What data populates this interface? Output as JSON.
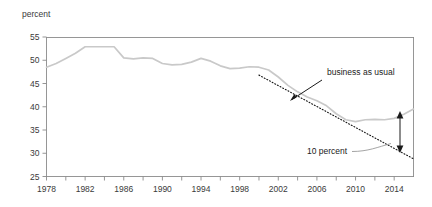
{
  "chart_data": {
    "type": "line",
    "title": "",
    "subtitle": "",
    "xlabel": "",
    "ylabel": "percent",
    "ylim": [
      25,
      55
    ],
    "xlim": [
      1978,
      2016
    ],
    "grid": false,
    "legend_position": "none",
    "yticks": [
      "55",
      "50",
      "45",
      "40",
      "35",
      "30",
      "25"
    ],
    "ytick_values": [
      55,
      50,
      45,
      40,
      35,
      30,
      25
    ],
    "xticks": [
      "1978",
      "1982",
      "1986",
      "1990",
      "1994",
      "1998",
      "2002",
      "2006",
      "2010",
      "2014"
    ],
    "xtick_values": [
      1978,
      1982,
      1986,
      1990,
      1994,
      1998,
      2002,
      2006,
      2010,
      2014
    ],
    "xtick_minor_values": [
      1980,
      1984,
      1988,
      1992,
      1996,
      2000,
      2004,
      2008,
      2012,
      2016
    ],
    "series": [
      {
        "name": "actual",
        "style": "solid",
        "color": "#c9c9c9",
        "x": [
          1978,
          1979,
          1980,
          1981,
          1982,
          1983,
          1984,
          1985,
          1986,
          1987,
          1988,
          1989,
          1990,
          1991,
          1992,
          1993,
          1994,
          1995,
          1996,
          1997,
          1998,
          1999,
          2000,
          2001,
          2002,
          2003,
          2004,
          2005,
          2006,
          2007,
          2008,
          2009,
          2010,
          2011,
          2012,
          2013,
          2014,
          2015,
          2016
        ],
        "values": [
          48.5,
          49.3,
          50.4,
          51.5,
          52.9,
          52.9,
          52.9,
          52.9,
          50.5,
          50.3,
          50.5,
          50.4,
          49.3,
          49.0,
          49.1,
          49.6,
          50.4,
          49.8,
          48.8,
          48.2,
          48.3,
          48.6,
          48.5,
          47.9,
          46.4,
          44.6,
          43.2,
          42.1,
          41.3,
          40.2,
          38.5,
          37.2,
          36.8,
          37.2,
          37.3,
          37.2,
          37.5,
          38.4,
          39.5
        ]
      },
      {
        "name": "business as usual",
        "style": "dotted",
        "color": "#1a1a1a",
        "x": [
          2000,
          2016
        ],
        "values": [
          46.8,
          28.8
        ]
      }
    ],
    "annotations": [
      {
        "name": "business-as-usual",
        "text": "business as usual",
        "text_x": 327,
        "text_y": 75,
        "arrow_from_x": 322,
        "arrow_from_y": 80,
        "arrow_to_x": 290,
        "arrow_to_y": 101
      },
      {
        "name": "ten-percent",
        "text": "10 percent",
        "text_x": 307,
        "text_y": 154,
        "leader_from_x": 352,
        "leader_from_y": 151,
        "leader_to_x": 391,
        "leader_to_y": 144
      },
      {
        "name": "gap-arrow",
        "text": "",
        "x": 400,
        "top_y": 113,
        "bottom_y": 151,
        "gap_value": 10
      }
    ],
    "colors": {
      "actual_line": "#c9c9c9",
      "projection_line": "#1a1a1a",
      "axis": "#8a8a8a",
      "text": "#3a3a3a",
      "annotation_text": "#222222",
      "background": "#ffffff"
    }
  }
}
